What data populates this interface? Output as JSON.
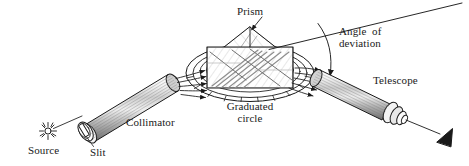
{
  "figure": {
    "kind": "prism-spectrometer-diagram",
    "background_color": "#ffffff",
    "ink_color": "#1a1a1a"
  },
  "labels": {
    "source": "Source",
    "slit": "Slit",
    "collimator": "Collimator",
    "prism": "Prism",
    "graduated_circle_line1": "Graduated",
    "graduated_circle_line2": "circle",
    "angle_of_deviation_line1": "Angle  of",
    "angle_of_deviation_line2": "deviation",
    "telescope": "Telescope"
  },
  "components": {
    "source_icon": "sun-burst-icon",
    "slit_icon": "vertical-slit-icon",
    "collimator_icon": "collimator-tube-icon",
    "prism_icon": "triangular-prism-icon",
    "graduated_circle_icon": "graduated-circle-icon",
    "telescope_icon": "telescope-tube-icon",
    "eye_icon": "eye-arrowhead-icon",
    "deviation_arc_icon": "deviation-arc-icon",
    "incident_rays_icon": "incident-ray-bundle-icon",
    "emergent_rays_icon": "emergent-ray-bundle-icon",
    "undeviated_ray_icon": "undeviated-ray-icon"
  }
}
